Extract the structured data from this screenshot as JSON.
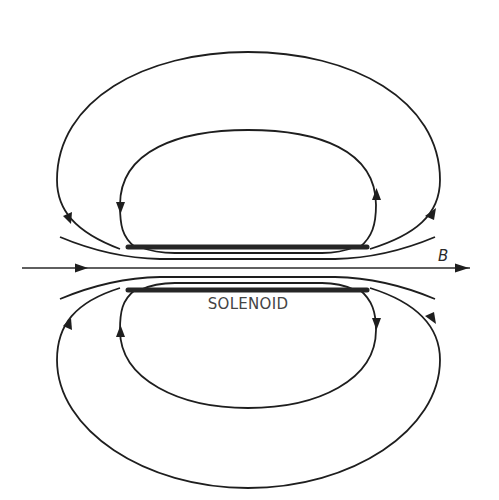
{
  "figure": {
    "labels": {
      "solenoid": "SOLENOID",
      "field": "B"
    },
    "colors": {
      "background": "#ffffff",
      "lines": "#1e1e1e",
      "coil": "#262626",
      "label": "#444444"
    },
    "elements": {
      "coil_plates": 2,
      "outer_loops": 4,
      "internal_field_lines": 5,
      "axis_arrows": 2
    }
  }
}
